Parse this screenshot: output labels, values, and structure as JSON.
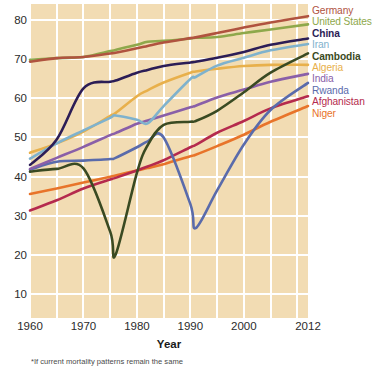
{
  "chart_data": {
    "type": "line",
    "title": "",
    "xlabel": "Year",
    "ylabel": "",
    "xlim": [
      1960,
      2012
    ],
    "ylim": [
      4,
      84
    ],
    "grid": true,
    "legend_position": "right",
    "x_ticks": [
      "1960",
      "1970",
      "1980",
      "1990",
      "2000",
      "2012"
    ],
    "x_tick_values": [
      1960,
      1970,
      1980,
      1990,
      2000,
      2012
    ],
    "y_ticks": [
      "10",
      "20",
      "30",
      "40",
      "50",
      "60",
      "70",
      "80"
    ],
    "y_tick_values": [
      10,
      20,
      30,
      40,
      50,
      60,
      70,
      80
    ],
    "x": [
      1960,
      1965,
      1970,
      1975,
      1976,
      1980,
      1982,
      1985,
      1990,
      1991,
      1995,
      2000,
      2005,
      2012
    ],
    "series": [
      {
        "name": "Germany",
        "color": "#b0533f",
        "bold": false,
        "values": [
          69.3,
          70.2,
          70.5,
          71.4,
          71.6,
          72.7,
          73.3,
          74.2,
          75.3,
          75.5,
          76.6,
          78.0,
          79.3,
          80.9
        ]
      },
      {
        "name": "United States",
        "color": "#8ea84b",
        "bold": false,
        "values": [
          69.8,
          70.2,
          70.5,
          72.0,
          72.3,
          73.6,
          74.4,
          74.6,
          75.2,
          75.4,
          75.6,
          76.6,
          77.5,
          78.8
        ]
      },
      {
        "name": "China",
        "color": "#2c1d56",
        "bold": true,
        "values": [
          43.0,
          49.5,
          62.5,
          64.2,
          64.5,
          66.5,
          67.2,
          68.2,
          69.1,
          69.3,
          70.3,
          71.8,
          73.6,
          75.2
        ]
      },
      {
        "name": "Iran",
        "color": "#7fb2cd",
        "bold": false,
        "values": [
          44.6,
          48.5,
          51.8,
          55.0,
          55.6,
          54.5,
          53.6,
          58.0,
          64.9,
          65.4,
          68.3,
          70.3,
          72.2,
          73.8
        ]
      },
      {
        "name": "Cambodia",
        "color": "#3a4a22",
        "bold": true,
        "values": [
          41.3,
          42.0,
          42.1,
          26.0,
          20.1,
          41.0,
          48.0,
          53.2,
          54.0,
          54.2,
          56.8,
          61.5,
          66.5,
          71.4
        ]
      },
      {
        "name": "Algeria",
        "color": "#e8b04b",
        "bold": false,
        "values": [
          46.1,
          48.5,
          51.5,
          55.5,
          56.2,
          60.5,
          62.0,
          64.0,
          66.5,
          66.8,
          67.5,
          68.2,
          68.5,
          68.5
        ]
      },
      {
        "name": "India",
        "color": "#8a5fa8",
        "bold": false,
        "values": [
          42.0,
          44.8,
          47.6,
          50.6,
          51.1,
          53.5,
          54.3,
          55.6,
          57.7,
          58.1,
          60.2,
          62.2,
          64.2,
          66.2
        ]
      },
      {
        "name": "Rwanda",
        "color": "#5a6bab",
        "bold": false,
        "values": [
          41.8,
          43.8,
          44.1,
          44.5,
          44.8,
          47.5,
          49.0,
          50.0,
          33.0,
          26.9,
          36.5,
          48.2,
          57.0,
          63.9
        ]
      },
      {
        "name": "Afghanistan",
        "color": "#b52a4d",
        "bold": false,
        "values": [
          31.4,
          34.0,
          37.0,
          39.3,
          39.7,
          41.6,
          42.6,
          44.2,
          47.5,
          48.1,
          51.2,
          54.2,
          57.4,
          60.5
        ]
      },
      {
        "name": "Niger",
        "color": "#e8742a",
        "bold": false,
        "values": [
          35.6,
          37.0,
          38.5,
          40.0,
          40.3,
          41.6,
          42.2,
          43.2,
          45.2,
          45.6,
          47.8,
          50.7,
          54.0,
          58.0
        ]
      }
    ]
  },
  "axis": {
    "x_title": "Year"
  },
  "footnote": {
    "text": "*If current mortality patterns remain the same"
  }
}
